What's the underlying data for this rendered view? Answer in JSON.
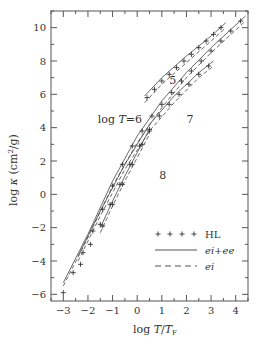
{
  "chart_data": {
    "type": "line",
    "title": "",
    "xlabel": "log T/T_F",
    "ylabel": "log κ (cm²/g)",
    "xlim": [
      -3.5,
      4.5
    ],
    "ylim": [
      -6.4,
      11.0
    ],
    "xticks": [
      -3,
      -2,
      -1,
      0,
      1,
      2,
      3,
      4
    ],
    "yticks": [
      -6,
      -4,
      -2,
      0,
      2,
      4,
      6,
      8,
      10
    ],
    "xtick_labels": [
      "−3",
      "−2",
      "−1",
      "0",
      "1",
      "2",
      "3",
      "4"
    ],
    "ytick_labels": [
      "−6",
      "−4",
      "−2",
      "0",
      "2",
      "4",
      "6",
      "8",
      "10"
    ],
    "grid": false,
    "legend_position": "bottom-right",
    "legend": [
      {
        "key": "HL",
        "label": "HL",
        "style": "cross"
      },
      {
        "key": "ei_ee",
        "label": "ei+ee",
        "style": "solid"
      },
      {
        "key": "ei",
        "label": "ei",
        "style": "dashed"
      }
    ],
    "curve_labels": [
      {
        "text": "5",
        "x": 1.3,
        "y": 6.6
      },
      {
        "text": "log T=6",
        "x": -1.6,
        "y": 4.3
      },
      {
        "text": "7",
        "x": 2.0,
        "y": 4.3
      },
      {
        "text": "8",
        "x": 0.9,
        "y": 0.9
      }
    ],
    "series": [
      {
        "name": "log T=5",
        "style": "ei_ee",
        "x": [
          0.3,
          1.0,
          2.0,
          3.0,
          3.6
        ],
        "y": [
          5.9,
          7.0,
          8.3,
          9.5,
          10.3
        ]
      },
      {
        "name": "log T=5",
        "style": "ei",
        "x": [
          0.3,
          1.0,
          2.0,
          3.0,
          3.6
        ],
        "y": [
          5.5,
          6.6,
          7.9,
          9.2,
          10.0
        ]
      },
      {
        "name": "log T=5",
        "style": "HL",
        "x": [
          0.4,
          0.7,
          1.0,
          1.3,
          1.6,
          1.9,
          2.2,
          2.5,
          2.8,
          3.1,
          3.4
        ],
        "y": [
          5.8,
          6.3,
          6.8,
          7.2,
          7.6,
          8.0,
          8.4,
          8.8,
          9.2,
          9.6,
          10.0
        ]
      },
      {
        "name": "log T=6",
        "style": "ei_ee",
        "x": [
          -3.0,
          -2.0,
          -1.0,
          0.0,
          1.0,
          2.0,
          3.0,
          4.4
        ],
        "y": [
          -5.3,
          -2.4,
          0.8,
          3.5,
          5.6,
          7.3,
          8.8,
          10.7
        ]
      },
      {
        "name": "log T=6",
        "style": "ei",
        "x": [
          -3.0,
          -2.0,
          -1.0,
          0.0,
          1.0,
          2.0,
          3.0,
          4.4
        ],
        "y": [
          -5.5,
          -2.6,
          0.5,
          3.1,
          5.2,
          7.0,
          8.5,
          10.4
        ]
      },
      {
        "name": "log T=6",
        "style": "HL",
        "x": [
          -3.0,
          -2.6,
          -2.2,
          -1.8,
          -1.4,
          -1.0,
          -0.6,
          -0.2,
          0.2,
          0.6,
          1.0,
          1.4,
          1.8,
          2.2,
          2.6,
          3.0,
          3.4,
          3.8,
          4.2
        ],
        "y": [
          -5.9,
          -4.7,
          -3.5,
          -2.2,
          -0.9,
          0.5,
          1.8,
          2.9,
          3.8,
          4.7,
          5.4,
          6.1,
          6.8,
          7.4,
          8.0,
          8.6,
          9.2,
          9.8,
          10.4
        ]
      },
      {
        "name": "log T=7",
        "style": "ei_ee",
        "x": [
          -2.4,
          -1.5,
          -0.5,
          0.5,
          1.5,
          2.5,
          3.1
        ],
        "y": [
          -3.7,
          -1.0,
          1.8,
          4.2,
          5.9,
          7.3,
          8.0
        ]
      },
      {
        "name": "log T=7",
        "style": "ei",
        "x": [
          -2.4,
          -1.5,
          -0.5,
          0.5,
          1.5,
          2.5,
          3.1
        ],
        "y": [
          -4.0,
          -1.3,
          1.5,
          3.8,
          5.5,
          7.0,
          7.7
        ]
      },
      {
        "name": "log T=7",
        "style": "HL",
        "x": [
          -2.3,
          -1.9,
          -1.5,
          -1.1,
          -0.7,
          -0.3,
          0.1,
          0.5,
          0.9,
          1.3,
          1.7,
          2.1,
          2.5,
          2.9
        ],
        "y": [
          -4.2,
          -3.0,
          -1.8,
          -0.6,
          0.6,
          1.8,
          2.9,
          3.9,
          4.7,
          5.4,
          6.0,
          6.6,
          7.2,
          7.7
        ]
      },
      {
        "name": "log T=8",
        "style": "ei_ee",
        "x": [
          -1.5,
          -1.0,
          -0.5,
          0.0,
          0.5
        ],
        "y": [
          -2.0,
          -0.4,
          1.1,
          2.5,
          3.9
        ]
      },
      {
        "name": "log T=8",
        "style": "ei",
        "x": [
          -1.5,
          -1.0,
          -0.5,
          0.0,
          0.5
        ],
        "y": [
          -2.3,
          -0.7,
          0.8,
          2.2,
          3.6
        ]
      },
      {
        "name": "log T=8",
        "style": "HL",
        "x": [
          -1.4,
          -1.0,
          -0.6,
          -0.2,
          0.2,
          0.5
        ],
        "y": [
          -1.9,
          -0.6,
          0.6,
          1.8,
          3.0,
          3.8
        ]
      }
    ]
  }
}
